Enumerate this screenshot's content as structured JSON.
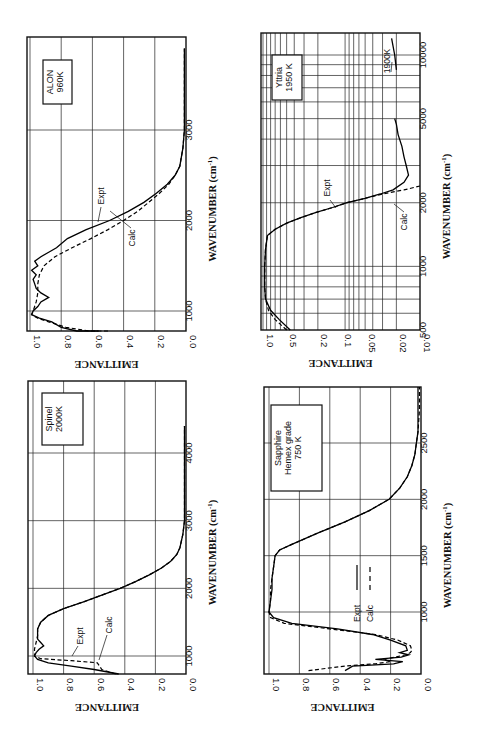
{
  "page": {
    "top_fragment": "spectral emittance"
  },
  "chart_data": [
    {
      "id": "alon",
      "type": "line",
      "orientation": "rotated-90",
      "title": "ALON 960K",
      "label_lines": [
        "ALON",
        "960K"
      ],
      "xlabel": "WAVENUMBER (cm-1)",
      "ylabel": "EMITTANCE",
      "x_ticks": [
        1000,
        2000,
        3000
      ],
      "y_ticks": [
        "1.0",
        "0.8",
        "0.6",
        "0.4",
        "0.2",
        "0.0"
      ],
      "xlim": [
        700,
        3900
      ],
      "ylim": [
        0,
        1
      ],
      "grid": true,
      "annotations": [
        "Expt",
        "Calc"
      ],
      "series": [
        {
          "name": "Expt",
          "style": "solid",
          "x": [
            700,
            760,
            820,
            880,
            920,
            960,
            1000,
            1050,
            1100,
            1150,
            1200,
            1250,
            1300,
            1350,
            1400,
            1450,
            1500,
            1550,
            1600,
            1650,
            1700,
            1800,
            1900,
            2000,
            2100,
            2200,
            2300,
            2400,
            2500,
            2600,
            2800,
            3000,
            3400,
            3900
          ],
          "y": [
            0.56,
            0.7,
            0.8,
            0.86,
            0.94,
            0.99,
            0.98,
            0.95,
            0.93,
            0.88,
            0.93,
            0.96,
            0.97,
            0.98,
            0.96,
            0.99,
            0.95,
            0.97,
            0.93,
            0.88,
            0.83,
            0.76,
            0.64,
            0.49,
            0.37,
            0.27,
            0.19,
            0.12,
            0.07,
            0.04,
            0.02,
            0.01,
            0.01,
            0.01
          ]
        },
        {
          "name": "Calc",
          "style": "dashed",
          "x": [
            700,
            760,
            820,
            880,
            920,
            960,
            1000,
            1100,
            1200,
            1300,
            1400,
            1500,
            1600,
            1700,
            1800,
            1900,
            2000,
            2100,
            2200,
            2300,
            2400,
            2500,
            2600,
            2800,
            3000,
            3400,
            3900
          ],
          "y": [
            0.5,
            0.62,
            0.77,
            0.88,
            0.95,
            0.99,
            0.98,
            0.96,
            0.95,
            0.95,
            0.94,
            0.91,
            0.84,
            0.73,
            0.61,
            0.5,
            0.4,
            0.31,
            0.24,
            0.17,
            0.11,
            0.07,
            0.04,
            0.02,
            0.01,
            0.01,
            0.01
          ]
        }
      ]
    },
    {
      "id": "yttria",
      "type": "line",
      "orientation": "rotated-90",
      "title": "Yttria 1950 K",
      "label_lines": [
        "Yttria",
        "1950 K"
      ],
      "xlabel": "WAVENUMBER (cm-1)",
      "ylabel": "EMITTANCE",
      "x_scale": "log",
      "y_scale": "log",
      "x_ticks": [
        500,
        1000,
        2000,
        5000,
        10000
      ],
      "y_ticks": [
        "1.0",
        "0.5",
        "0.2",
        "0.1",
        "0.05",
        "0.02",
        "0.01"
      ],
      "xlim": [
        500,
        13000
      ],
      "ylim": [
        0.01,
        1.0
      ],
      "grid": true,
      "annotations": [
        "Expt",
        "Calc",
        "1900K"
      ],
      "series": [
        {
          "name": "Expt",
          "style": "solid",
          "x": [
            500,
            560,
            620,
            700,
            800,
            1000,
            1200,
            1400,
            1500,
            1600,
            1700,
            1800,
            1900,
            2000,
            2100,
            2200,
            2300,
            2500,
            2700,
            3000,
            3300,
            3700,
            4200,
            4700,
            5000
          ],
          "y": [
            0.45,
            0.62,
            0.8,
            0.93,
            0.95,
            0.95,
            0.93,
            0.88,
            0.7,
            0.5,
            0.33,
            0.21,
            0.13,
            0.085,
            0.05,
            0.032,
            0.022,
            0.016,
            0.014,
            0.015,
            0.016,
            0.017,
            0.019,
            0.02,
            0.021
          ]
        },
        {
          "name": "Calc",
          "style": "dashed",
          "x": [
            500,
            560,
            620,
            700,
            800,
            1000,
            1200,
            1400,
            1500,
            1600,
            1700,
            1800,
            1900,
            2000,
            2100,
            2200,
            2300,
            2400
          ],
          "y": [
            0.5,
            0.7,
            0.85,
            0.93,
            0.95,
            0.95,
            0.93,
            0.88,
            0.7,
            0.5,
            0.33,
            0.21,
            0.13,
            0.085,
            0.05,
            0.03,
            0.016,
            0.01
          ]
        },
        {
          "name": "1900K",
          "style": "solid",
          "x": [
            8500,
            10000,
            12000
          ],
          "y": [
            0.02,
            0.021,
            0.023
          ]
        }
      ]
    },
    {
      "id": "spinel",
      "type": "line",
      "orientation": "rotated-90",
      "title": "Spinel 2000K",
      "label_lines": [
        "Spinel",
        "2000K"
      ],
      "xlabel": "WAVENUMBER (cm-1)",
      "ylabel": "EMITTANCE",
      "x_ticks": [
        1000,
        2000,
        3000,
        4000
      ],
      "y_ticks": [
        "1.0",
        "0.8",
        "0.6",
        "0.4",
        "0.2",
        "0.0"
      ],
      "xlim": [
        730,
        4400
      ],
      "ylim": [
        0,
        1
      ],
      "grid": true,
      "annotations": [
        "Expt",
        "Calc"
      ],
      "series": [
        {
          "name": "Expt",
          "style": "solid",
          "x": [
            730,
            800,
            850,
            900,
            950,
            1000,
            1050,
            1100,
            1150,
            1200,
            1250,
            1300,
            1400,
            1500,
            1600,
            1700,
            1800,
            1900,
            2000,
            2100,
            2200,
            2300,
            2400,
            2500,
            2600,
            2800,
            3000,
            3500,
            4400
          ],
          "y": [
            0.44,
            0.6,
            0.75,
            0.9,
            0.97,
            0.99,
            0.98,
            0.96,
            0.93,
            0.95,
            0.97,
            0.97,
            0.97,
            0.95,
            0.9,
            0.8,
            0.67,
            0.55,
            0.43,
            0.33,
            0.24,
            0.16,
            0.1,
            0.06,
            0.04,
            0.02,
            0.01,
            0.01,
            0.01
          ]
        },
        {
          "name": "Calc",
          "style": "dashed",
          "x": [
            730,
            800,
            900,
            930,
            960,
            1000,
            1100,
            1200,
            1300,
            1400,
            1500,
            1600,
            1700,
            1800,
            1900,
            2000,
            2100,
            2200,
            2300,
            2400,
            2500,
            2600,
            2800,
            3000,
            3500,
            4400
          ],
          "y": [
            0.46,
            0.55,
            0.58,
            0.75,
            0.95,
            0.99,
            0.99,
            0.98,
            0.97,
            0.97,
            0.95,
            0.9,
            0.8,
            0.67,
            0.55,
            0.43,
            0.33,
            0.24,
            0.16,
            0.1,
            0.06,
            0.04,
            0.02,
            0.01,
            0.01,
            0.01
          ]
        }
      ]
    },
    {
      "id": "sapphire",
      "type": "line",
      "orientation": "rotated-90",
      "title": "Sapphire Hemex grade 750 K",
      "label_lines": [
        "Sapphire",
        "Hemex grade",
        "750 K"
      ],
      "xlabel": "WAVENUMBER (cm-1)",
      "ylabel": "EMITTANCE",
      "x_ticks": [
        1000,
        1500,
        2000,
        2500
      ],
      "y_ticks": [
        "1.0",
        "0.8",
        "0.6",
        "0.4",
        "0.2",
        "0.0"
      ],
      "xlim": [
        480,
        3000
      ],
      "ylim": [
        0,
        1
      ],
      "grid": true,
      "legend": {
        "position": "inside",
        "entries": [
          {
            "label": "Expt",
            "style": "solid"
          },
          {
            "label": "Calc",
            "style": "dashed"
          }
        ]
      },
      "series": [
        {
          "name": "Expt",
          "style": "solid",
          "x": [
            480,
            520,
            540,
            560,
            580,
            600,
            620,
            640,
            660,
            700,
            750,
            800,
            850,
            900,
            950,
            1000,
            1100,
            1200,
            1300,
            1400,
            1500,
            1550,
            1600,
            1700,
            1800,
            1900,
            2000,
            2100,
            2200,
            2300,
            2400,
            2500,
            2600,
            2800,
            3000
          ],
          "y": [
            0.5,
            0.45,
            0.18,
            0.12,
            0.3,
            0.13,
            0.08,
            0.14,
            0.09,
            0.1,
            0.2,
            0.32,
            0.55,
            0.85,
            0.97,
            1.0,
            0.99,
            0.98,
            0.98,
            0.97,
            0.96,
            0.93,
            0.85,
            0.68,
            0.5,
            0.34,
            0.21,
            0.14,
            0.09,
            0.06,
            0.04,
            0.03,
            0.02,
            0.02,
            0.02
          ]
        },
        {
          "name": "Calc",
          "style": "dashed",
          "x": [
            480,
            520,
            540,
            560,
            580,
            600,
            620,
            640,
            660,
            700,
            750,
            800,
            850,
            900,
            950,
            1000,
            1100,
            1200,
            1300,
            1400,
            1500,
            1550,
            1600,
            1700,
            1800,
            1900,
            2000,
            2100,
            2200,
            2300,
            2400,
            2500,
            2600,
            2800,
            3000
          ],
          "y": [
            0.74,
            0.5,
            0.3,
            0.2,
            0.25,
            0.17,
            0.1,
            0.07,
            0.06,
            0.07,
            0.15,
            0.3,
            0.6,
            0.9,
            0.99,
            1.0,
            0.99,
            0.99,
            0.98,
            0.97,
            0.96,
            0.93,
            0.85,
            0.68,
            0.5,
            0.34,
            0.21,
            0.14,
            0.09,
            0.06,
            0.04,
            0.03,
            0.02,
            0.01,
            0.01
          ]
        }
      ]
    }
  ]
}
